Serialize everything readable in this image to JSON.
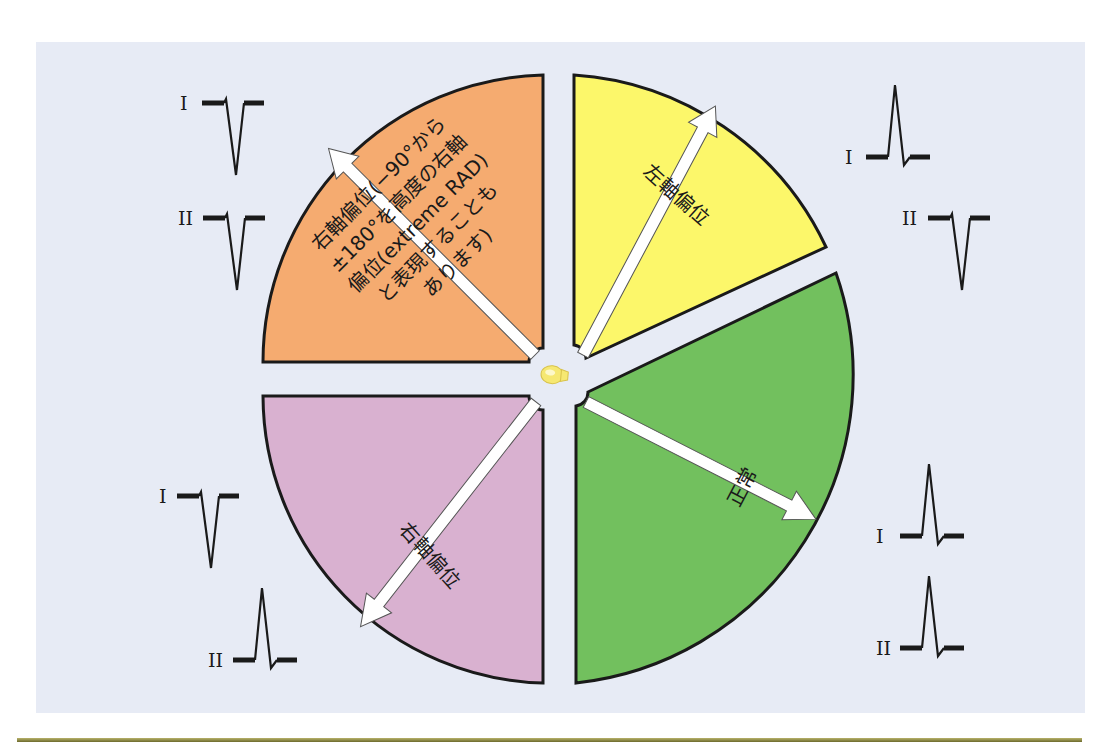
{
  "figure": {
    "colors": {
      "background_panel": "#e7ebf5",
      "rule": "#8a8740",
      "orange": "#f5ab70",
      "yellow": "#fcf76a",
      "green": "#72c05e",
      "purple": "#d9b1d0",
      "heart": "#f6e872"
    },
    "center_icon": "heart-icon",
    "quadrants": [
      {
        "id": "extreme-rad",
        "color": "orange",
        "label_lines": [
          "右軸偏位(−90°から",
          "±180°を高度の右軸",
          "偏位(extreme RAD)",
          "と表現することも",
          "あります)"
        ],
        "leads": [
          {
            "lead": "I",
            "deflection": "negative"
          },
          {
            "lead": "II",
            "deflection": "negative"
          }
        ]
      },
      {
        "id": "left-axis-deviation",
        "color": "yellow",
        "label": "左軸偏位",
        "leads": [
          {
            "lead": "I",
            "deflection": "positive"
          },
          {
            "lead": "II",
            "deflection": "negative"
          }
        ]
      },
      {
        "id": "normal",
        "color": "green",
        "label": "正常",
        "leads": [
          {
            "lead": "I",
            "deflection": "positive"
          },
          {
            "lead": "II",
            "deflection": "positive"
          }
        ]
      },
      {
        "id": "right-axis-deviation",
        "color": "purple",
        "label": "右軸偏位",
        "leads": [
          {
            "lead": "I",
            "deflection": "negative"
          },
          {
            "lead": "II",
            "deflection": "positive"
          }
        ]
      }
    ],
    "lead_labels": {
      "I": "I",
      "II": "II"
    }
  }
}
